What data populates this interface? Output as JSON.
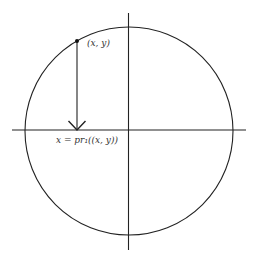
{
  "diagram": {
    "colors": {
      "stroke": "#222222",
      "text": "#333333",
      "background": "#ffffff"
    },
    "circle": {
      "cx": 129,
      "cy": 131,
      "r": 104
    },
    "axes": {
      "horizontal": {
        "x1": 12,
        "y1": 130,
        "x2": 246,
        "y2": 130
      },
      "vertical": {
        "x1": 128,
        "y1": 13,
        "x2": 129,
        "y2": 250
      }
    },
    "point": {
      "x": 77,
      "y": 41,
      "label": "(x, y)"
    },
    "projection_arrow": {
      "x1": 77,
      "y1": 41,
      "x2": 77,
      "y2": 130
    },
    "projection_label": "x = pr₁((x, y))"
  }
}
